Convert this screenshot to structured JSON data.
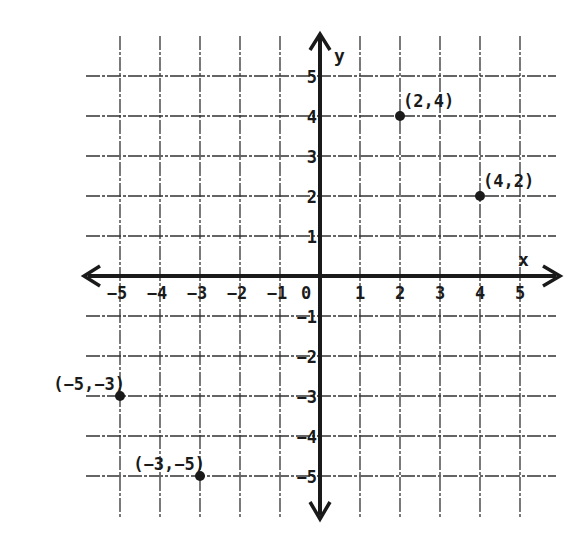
{
  "chart_data": {
    "type": "scatter",
    "title": "",
    "xlabel": "x",
    "ylabel": "y",
    "xlim": [
      -5,
      5
    ],
    "ylim": [
      -5,
      5
    ],
    "grid": true,
    "x_ticks": [
      "-5",
      "-4",
      "-3",
      "-2",
      "-1",
      "0",
      "1",
      "2",
      "3",
      "4",
      "5"
    ],
    "y_ticks": [
      "5",
      "4",
      "3",
      "2",
      "1",
      "-1",
      "-2",
      "-3",
      "-4",
      "-5"
    ],
    "points": [
      {
        "x": 2,
        "y": 4,
        "label": "(2,4)"
      },
      {
        "x": 4,
        "y": 2,
        "label": "(4,2)"
      },
      {
        "x": -5,
        "y": -3,
        "label": "(−5,−3)"
      },
      {
        "x": -3,
        "y": -5,
        "label": "(−3,−5)"
      }
    ]
  },
  "colors": {
    "ink": "#1a1a1a",
    "grid": "#333333",
    "background": "#ffffff"
  }
}
